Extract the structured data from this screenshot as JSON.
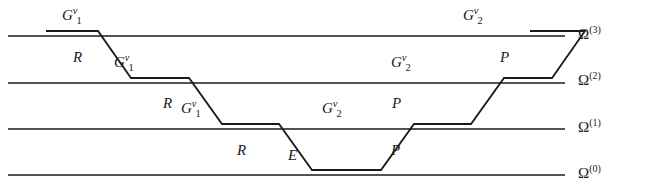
{
  "figure": {
    "type": "multigrid-v-cycle-diagram",
    "width": 648,
    "height": 194,
    "background": "#ffffff",
    "line_color": "#1a1a1a"
  },
  "levels": [
    {
      "id": "omega-3",
      "name": "Ω",
      "superscript": "(3)",
      "y": 36,
      "label_x": 578,
      "label_y": 27
    },
    {
      "id": "omega-2",
      "name": "Ω",
      "superscript": "(2)",
      "y": 83,
      "label_x": 578,
      "label_y": 73
    },
    {
      "id": "omega-1",
      "name": "Ω",
      "superscript": "(1)",
      "y": 129,
      "label_x": 578,
      "label_y": 120
    },
    {
      "id": "omega-0",
      "name": "Ω",
      "superscript": "(0)",
      "y": 175,
      "label_x": 578,
      "label_y": 166
    }
  ],
  "cycle_path": {
    "description": "V-cycle descending from the finest grid level to the coarsest and back up",
    "points": [
      {
        "x": 46,
        "y": 31
      },
      {
        "x": 98,
        "y": 31
      },
      {
        "x": 131,
        "y": 78
      },
      {
        "x": 189,
        "y": 78
      },
      {
        "x": 222,
        "y": 124
      },
      {
        "x": 279,
        "y": 124
      },
      {
        "x": 312,
        "y": 170
      },
      {
        "x": 381,
        "y": 170
      },
      {
        "x": 414,
        "y": 124
      },
      {
        "x": 471,
        "y": 124
      },
      {
        "x": 504,
        "y": 78
      },
      {
        "x": 552,
        "y": 78
      },
      {
        "x": 585,
        "y": 31
      },
      {
        "x": 530,
        "y": 31
      }
    ]
  },
  "smoothing_segments": [
    {
      "id": "smooth-l3-down",
      "label": "G",
      "superscript": "ν",
      "subscript": "1",
      "x1": 46,
      "x2": 98,
      "y": 31,
      "label_x": 62,
      "label_y": 8
    },
    {
      "id": "smooth-l2-down",
      "label": "G",
      "superscript": "ν",
      "subscript": "1",
      "x1": 131,
      "x2": 189,
      "y": 78,
      "label_x": 114,
      "label_y": 55
    },
    {
      "id": "smooth-l1-down",
      "label": "G",
      "superscript": "ν",
      "subscript": "1",
      "x1": 222,
      "x2": 279,
      "y": 124,
      "label_x": 181,
      "label_y": 101
    },
    {
      "id": "coarse-solve",
      "label": "E",
      "superscript": "",
      "subscript": "",
      "x1": 312,
      "x2": 381,
      "y": 170,
      "label_x": 288,
      "label_y": 148
    },
    {
      "id": "smooth-l1-up",
      "label": "G",
      "superscript": "ν",
      "subscript": "2",
      "x1": 414,
      "x2": 471,
      "y": 124,
      "label_x": 322,
      "label_y": 101
    },
    {
      "id": "smooth-l2-up",
      "label": "G",
      "superscript": "ν",
      "subscript": "2",
      "x1": 504,
      "x2": 552,
      "y": 78,
      "label_x": 391,
      "label_y": 55
    },
    {
      "id": "smooth-l3-up",
      "label": "G",
      "superscript": "ν",
      "subscript": "2",
      "x1": 530,
      "x2": 585,
      "y": 31,
      "label_x": 463,
      "label_y": 8
    }
  ],
  "transfer_labels": [
    {
      "id": "restrict-3-2",
      "text": "R",
      "x": 73,
      "y": 50
    },
    {
      "id": "restrict-2-1",
      "text": "R",
      "x": 163,
      "y": 96
    },
    {
      "id": "restrict-1-0",
      "text": "R",
      "x": 237,
      "y": 143
    },
    {
      "id": "prolong-0-1",
      "text": "P",
      "x": 391,
      "y": 143
    },
    {
      "id": "prolong-1-2",
      "text": "P",
      "x": 392,
      "y": 96
    },
    {
      "id": "prolong-2-3",
      "text": "P",
      "x": 500,
      "y": 50
    }
  ]
}
